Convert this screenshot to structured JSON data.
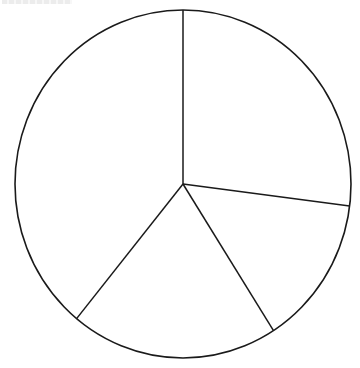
{
  "chart_data": {
    "type": "pie",
    "title": "",
    "title_clipped": true,
    "slices": [
      {
        "label": "",
        "value": 27,
        "start_angle_deg": 0,
        "end_angle_deg": 97.3
      },
      {
        "label": "",
        "value": 14,
        "start_angle_deg": 97.3,
        "end_angle_deg": 147.4
      },
      {
        "label": "",
        "value": 20,
        "start_angle_deg": 147.4,
        "end_angle_deg": 219.3
      },
      {
        "label": "",
        "value": 39,
        "start_angle_deg": 219.3,
        "end_angle_deg": 360
      }
    ],
    "values": [
      27,
      14,
      20,
      39
    ],
    "categories": [
      "",
      "",
      "",
      ""
    ],
    "start": "12 o'clock",
    "direction": "clockwise",
    "fill": "#ffffff",
    "stroke": "#1a1a1a",
    "legend": "none",
    "data_labels": "none",
    "geometry": {
      "cx": 183,
      "cy": 184,
      "rx": 168,
      "ry": 174
    }
  }
}
